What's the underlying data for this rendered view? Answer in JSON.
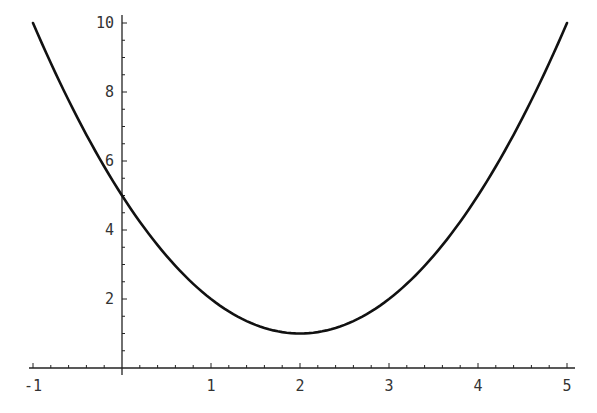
{
  "chart_data": {
    "type": "line",
    "title": "",
    "xlabel": "",
    "ylabel": "",
    "function": "y = (x - 2)^2 + 1",
    "xlim": [
      -1,
      5
    ],
    "ylim": [
      0,
      10
    ],
    "grid": false,
    "legend": null,
    "series": [
      {
        "name": "f(x)",
        "x": [
          -1,
          -0.5,
          0,
          0.5,
          1,
          1.5,
          2,
          2.5,
          3,
          3.5,
          4,
          4.5,
          5
        ],
        "values": [
          10,
          7.25,
          5,
          3.25,
          2,
          1.25,
          1,
          1.25,
          2,
          3.25,
          5,
          7.25,
          10
        ]
      }
    ],
    "x_ticks": [
      {
        "value": -1,
        "label": "-1"
      },
      {
        "value": 1,
        "label": "1"
      },
      {
        "value": 2,
        "label": "2"
      },
      {
        "value": 3,
        "label": "3"
      },
      {
        "value": 4,
        "label": "4"
      },
      {
        "value": 5,
        "label": "5"
      }
    ],
    "y_ticks": [
      {
        "value": 2,
        "label": "2"
      },
      {
        "value": 4,
        "label": "4"
      },
      {
        "value": 6,
        "label": "6"
      },
      {
        "value": 8,
        "label": "8"
      },
      {
        "value": 10,
        "label": "10"
      }
    ],
    "x_minor_step": 0.2,
    "y_minor_step": 0.5
  },
  "style": {
    "curve_color": "#111111",
    "axis_color": "#222222",
    "label_color": "#333333"
  }
}
